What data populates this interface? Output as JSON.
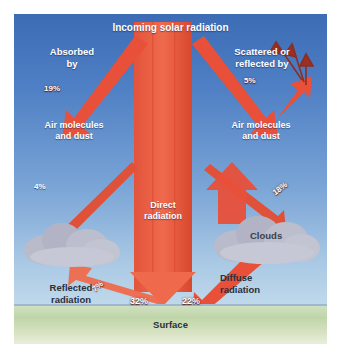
{
  "figure": {
    "title": "Incoming solar radiation",
    "surface_label": "Surface",
    "clouds_label": "Clouds",
    "direct_label_line1": "Direct",
    "direct_label_line2": "radiation",
    "diffuse_label_line1": "Diffuse",
    "diffuse_label_line2": "radiation",
    "reflected_label_line1": "Reflected",
    "reflected_label_line2": "radiation",
    "left_branch": {
      "heading_line1": "Absorbed",
      "heading_line2": "by",
      "percent": "19%",
      "agent_line1": "Air molecules",
      "agent_line2": "and dust"
    },
    "right_branch": {
      "heading_line1": "Scattered or",
      "heading_line2": "reflected by",
      "percent": "5%",
      "agent_line1": "Air molecules",
      "agent_line2": "and dust"
    },
    "percents": {
      "cloud_left": "4%",
      "cloud_right": "18%",
      "reflected": "7%",
      "direct_surface": "32%",
      "diffuse_surface": "22%"
    },
    "colors": {
      "arrow_red": "#e8503a",
      "arrow_red_dark": "#c8402c",
      "sky_top": "#3b6cb5",
      "sky_bottom": "#c3dbec",
      "ground": "#cfe0c0",
      "cloud": "#b4b6c6",
      "text_light": "#ffffff",
      "text_dark": "#2a2f3a"
    }
  }
}
